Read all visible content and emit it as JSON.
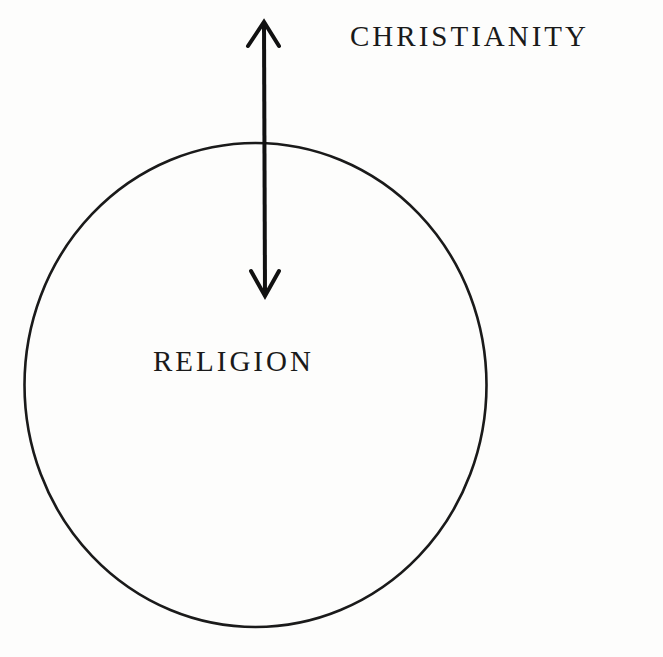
{
  "diagram": {
    "outer_label": "CHRISTIANITY",
    "inner_label": "RELIGION",
    "shapes": {
      "circle": {
        "cx": 255,
        "cy": 385,
        "rx": 231,
        "ry": 242,
        "stroke": "#1a1a1a",
        "label": "RELIGION"
      },
      "arrow": {
        "type": "double-headed",
        "x": 264,
        "y_top": 22,
        "y_bottom": 296,
        "stroke": "#111111"
      }
    },
    "colors": {
      "background": "#fdfdfc",
      "ink": "#1a1a1a"
    }
  }
}
